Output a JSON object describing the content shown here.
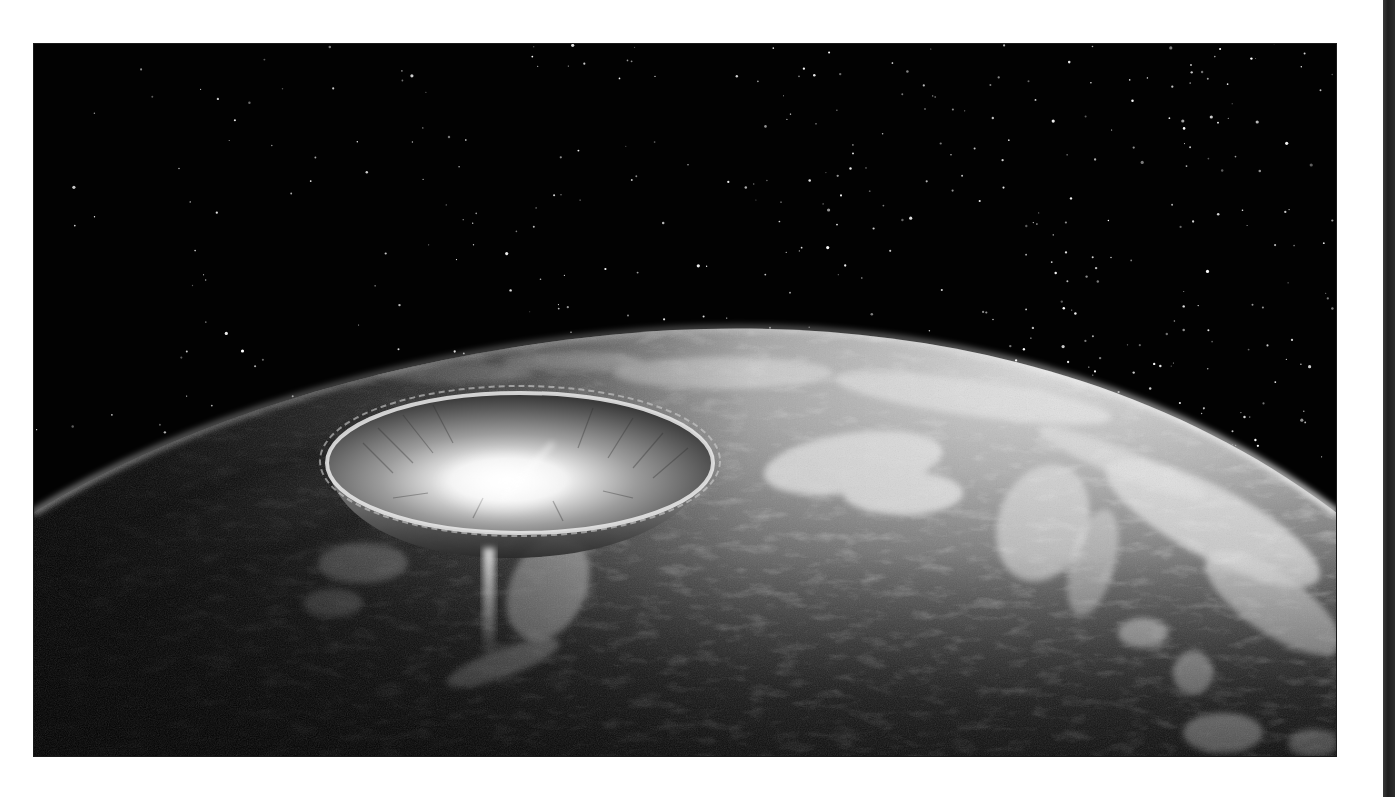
{
  "image": {
    "subject": "Asteroid impact crater on Earth viewed from orbit",
    "alt": "Grayscale illustration of a large impact crater on Earth's surface seen from space, with a curved horizon and a starfield above",
    "palette": {
      "space": "#020202",
      "planet_dark": "#161616",
      "planet_mid": "#5a5a5a",
      "planet_light": "#d8d8d8",
      "crater_glow": "#ffffff",
      "page_bg": "#ffffff",
      "edge_strip": "#2a2a2a"
    },
    "frame": {
      "x": 33,
      "y": 43,
      "width": 1304,
      "height": 714
    },
    "stars": {
      "count": 420,
      "seed": 7,
      "density_bias": "upper-right"
    },
    "crater": {
      "cx": 487,
      "cy": 420,
      "rx": 193,
      "ry": 70
    }
  }
}
